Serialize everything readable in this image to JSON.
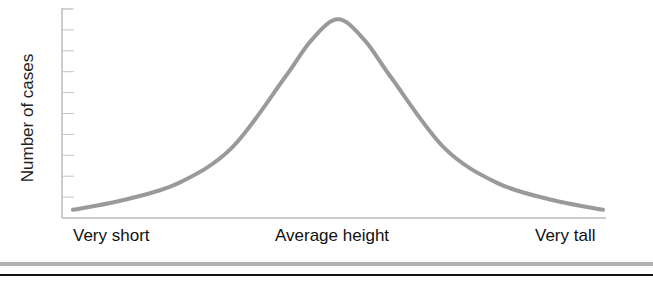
{
  "chart_data": {
    "type": "line",
    "title": "",
    "xlabel": "",
    "ylabel": "Number of cases",
    "x_tick_labels": [
      "Very short",
      "Average height",
      "Very tall"
    ],
    "y_tick_labels": [],
    "y_tick_count": 10,
    "grid": false,
    "legend": null,
    "series": [
      {
        "name": "Height distribution",
        "color": "#9a9a9a",
        "x": [
          0.0,
          0.1,
          0.2,
          0.3,
          0.4,
          0.45,
          0.5,
          0.55,
          0.6,
          0.7,
          0.8,
          0.9,
          1.0
        ],
        "y": [
          0.03,
          0.08,
          0.16,
          0.33,
          0.67,
          0.85,
          0.95,
          0.85,
          0.67,
          0.33,
          0.16,
          0.08,
          0.03
        ]
      }
    ],
    "xlim": [
      0,
      1
    ],
    "ylim": [
      0,
      1
    ]
  },
  "labels": {
    "ylabel": "Number of cases",
    "x_left": "Very short",
    "x_mid": "Average height",
    "x_right": "Very tall"
  },
  "colors": {
    "axis": "#bdbdbd",
    "curve": "#9a9a9a",
    "text": "#111111",
    "rule_gray": "#b0b0b0",
    "rule_black": "#111111"
  }
}
